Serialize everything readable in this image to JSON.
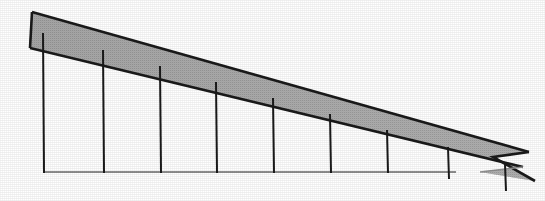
{
  "figure": {
    "canvas": {
      "width": 545,
      "height": 201,
      "background_color": "#ffffff"
    },
    "colors": {
      "band_fill": "#a9a9a9",
      "band_fill_light": "#bdbdbd",
      "outline": "#1a1a1a",
      "tick": "#1a1a1a",
      "baseline": "#8f8f8f",
      "background": "#ffffff"
    },
    "strokes": {
      "outline_width": 2.6,
      "tick_width": 2.0,
      "baseline_width": 2.2
    },
    "band": {
      "name": "shaded-band",
      "top_edge": {
        "x1": 32,
        "y1": 12,
        "x2": 529,
        "y2": 152
      },
      "bottom_edge": {
        "x1": 30,
        "y1": 48,
        "x2": 523,
        "y2": 167
      },
      "left_cap": {
        "x1": 32,
        "y1": 12,
        "x2": 30,
        "y2": 48
      },
      "outline_points": "32,12 529,152 493,157 535,181 480,172 523,167 30,48",
      "fill_points": "32,12 529,152 493,157 535,181 480,172 523,167 30,48",
      "tail_notch_apex": {
        "x": 493,
        "y": 157
      },
      "tail_upper_tip": {
        "x": 535,
        "y": 181
      },
      "tail_lower_tip": {
        "x": 480,
        "y": 172
      }
    },
    "baseline": {
      "name": "baseline",
      "x1": 43,
      "y1": 172,
      "x2": 456,
      "y2": 172
    },
    "ticks": [
      {
        "index": 1,
        "x": 43,
        "y_top": 33,
        "y_bottom": 173
      },
      {
        "index": 2,
        "x": 103,
        "y_top": 50,
        "y_bottom": 173
      },
      {
        "index": 3,
        "x": 160,
        "y_top": 66,
        "y_bottom": 173
      },
      {
        "index": 4,
        "x": 216,
        "y_top": 82,
        "y_bottom": 173
      },
      {
        "index": 5,
        "x": 273,
        "y_top": 98,
        "y_bottom": 173
      },
      {
        "index": 6,
        "x": 330,
        "y_top": 114,
        "y_bottom": 173
      },
      {
        "index": 7,
        "x": 387,
        "y_top": 130,
        "y_bottom": 173
      },
      {
        "index": 8,
        "x": 448,
        "y_top": 147,
        "y_bottom": 179
      },
      {
        "index": 9,
        "x": 505,
        "y_top": 164,
        "y_bottom": 191
      }
    ]
  }
}
